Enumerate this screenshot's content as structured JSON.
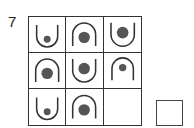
{
  "question_number": "7",
  "colors": {
    "line": "#333333",
    "dot": "#555555",
    "background": "#ffffff"
  },
  "matrix": {
    "rows": 3,
    "cols": 3,
    "cells": [
      {
        "row": 1,
        "col": 1,
        "arc": "cup-open-up",
        "dot": "small",
        "dot_position": "bottom"
      },
      {
        "row": 1,
        "col": 2,
        "arc": "arch-open-down",
        "dot": "large",
        "dot_position": "center"
      },
      {
        "row": 1,
        "col": 3,
        "arc": "cup-open-up",
        "dot": "large",
        "dot_position": "center"
      },
      {
        "row": 2,
        "col": 1,
        "arc": "arch-open-down",
        "dot": "large",
        "dot_position": "center"
      },
      {
        "row": 2,
        "col": 2,
        "arc": "cup-open-up",
        "dot": "large",
        "dot_position": "center"
      },
      {
        "row": 2,
        "col": 3,
        "arc": "arch-open-down",
        "dot": "small",
        "dot_position": "top"
      },
      {
        "row": 3,
        "col": 1,
        "arc": "cup-open-up",
        "dot": "small",
        "dot_position": "bottom"
      },
      {
        "row": 3,
        "col": 2,
        "arc": "arch-open-down",
        "dot": "large",
        "dot_position": "center"
      },
      {
        "row": 3,
        "col": 3,
        "arc": "none",
        "dot": "none",
        "missing": true
      }
    ]
  },
  "answer_box": {
    "label": "",
    "state": "empty"
  }
}
